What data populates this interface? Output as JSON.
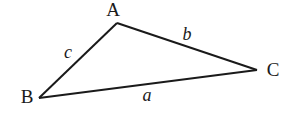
{
  "diagram": {
    "type": "triangle",
    "vertices": [
      {
        "id": "A",
        "label": "A",
        "x": 117,
        "y": 23,
        "label_x": 113,
        "label_y": 16
      },
      {
        "id": "B",
        "label": "B",
        "x": 39,
        "y": 98,
        "label_x": 27,
        "label_y": 103
      },
      {
        "id": "C",
        "label": "C",
        "x": 257,
        "y": 70,
        "label_x": 273,
        "label_y": 76
      }
    ],
    "sides": [
      {
        "id": "a",
        "label": "a",
        "from": "B",
        "to": "C",
        "label_x": 147,
        "label_y": 101
      },
      {
        "id": "b",
        "label": "b",
        "from": "A",
        "to": "C",
        "label_x": 187,
        "label_y": 40
      },
      {
        "id": "c",
        "label": "c",
        "from": "A",
        "to": "B",
        "label_x": 68,
        "label_y": 58
      }
    ],
    "line_color": "#1a1a1a"
  }
}
